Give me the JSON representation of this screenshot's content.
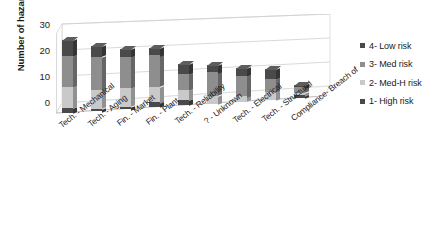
{
  "chart_data": {
    "type": "bar",
    "subtype": "stacked-column-3d",
    "title": "",
    "xlabel": "",
    "ylabel": "Number of hazards",
    "ylim": [
      0,
      30
    ],
    "yticks": [
      0,
      10,
      20,
      30
    ],
    "grid": true,
    "legend_position": "right",
    "categories": [
      "Tech. - Mechanical",
      "Tech. - Aging",
      "Fin. - Market",
      "Fin. - Plant",
      "Tech. - Reliability",
      "? - Unknown",
      "Tech. - Electrical",
      "Tech. - Structural",
      "Compliance- Breach of"
    ],
    "series": [
      {
        "name": "1- High risk",
        "color": "#4a4a4a",
        "values": [
          2,
          1,
          1,
          2,
          2,
          0,
          0,
          0,
          1
        ]
      },
      {
        "name": "2- Med-H risk",
        "color": "#c9c9c9",
        "values": [
          8,
          7,
          7,
          6,
          4,
          3,
          2,
          3,
          1
        ]
      },
      {
        "name": "3- Med risk",
        "color": "#8e8e8e",
        "values": [
          12,
          13,
          12,
          12,
          6,
          9,
          8,
          5,
          2
        ]
      },
      {
        "name": "4- Low risk",
        "color": "#4a4a4a",
        "values": [
          6,
          4,
          3,
          3,
          4,
          3,
          3,
          4,
          1
        ]
      }
    ],
    "totals": [
      28,
      25,
      23,
      23,
      16,
      15,
      13,
      12,
      5
    ]
  },
  "legend": {
    "items": [
      {
        "label": "4- Low risk",
        "color": "#4a4a4a"
      },
      {
        "label": "3- Med risk",
        "color": "#8e8e8e"
      },
      {
        "label": "2- Med-H risk",
        "color": "#c9c9c9"
      },
      {
        "label": "1- High risk",
        "color": "#4a4a4a"
      }
    ]
  },
  "axis": {
    "y_title": "Number of hazards",
    "y_labels": [
      "30",
      "20",
      "10",
      "0"
    ]
  }
}
